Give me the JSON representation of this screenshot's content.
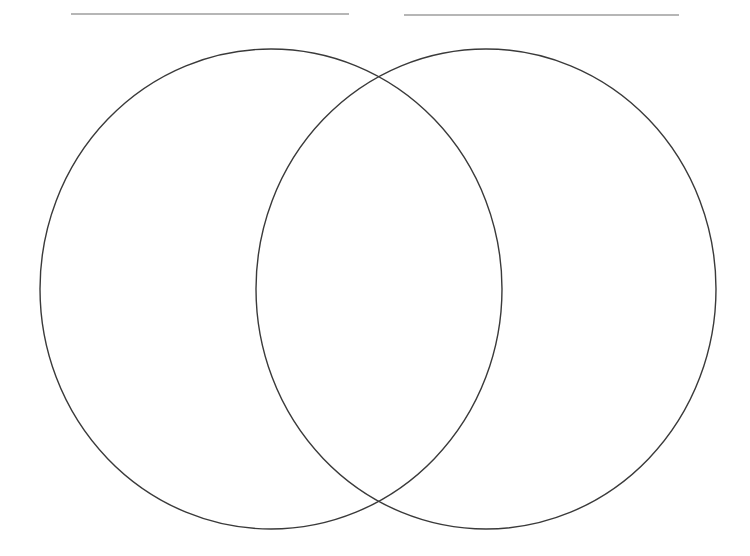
{
  "diagram": {
    "type": "venn",
    "canvas": {
      "width": 750,
      "height": 556,
      "background": "#ffffff"
    },
    "stroke_color": "#3a3a3a",
    "line_color": "#6e6e6e",
    "label_lines": [
      {
        "id": "left-label-line",
        "x1": 71,
        "y1": 14,
        "x2": 349,
        "y2": 14
      },
      {
        "id": "right-label-line",
        "x1": 404,
        "y1": 15,
        "x2": 679,
        "y2": 15
      }
    ],
    "circles": [
      {
        "id": "left-circle",
        "cx": 271,
        "cy": 289,
        "rx": 231,
        "ry": 240
      },
      {
        "id": "right-circle",
        "cx": 486,
        "cy": 289,
        "rx": 230,
        "ry": 240
      }
    ],
    "texts": []
  }
}
